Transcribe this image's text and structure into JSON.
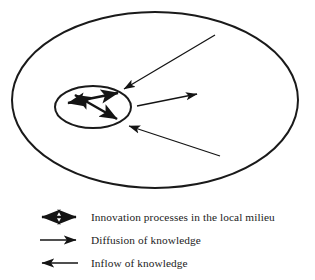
{
  "figure": {
    "background_color": "#ffffff",
    "stroke_color": "#1a1a1a"
  },
  "diagram": {
    "outer_region": {
      "name": "outer-ellipse",
      "role": "wider region surrounding the local milieu",
      "cx": 155,
      "cy": 100,
      "rx": 143,
      "ry": 88,
      "stroke_width": 2.0
    },
    "inner_region": {
      "name": "inner-ellipse",
      "role": "local milieu",
      "cx": 93,
      "cy": 107,
      "rx": 38,
      "ry": 21,
      "stroke_width": 2.0
    },
    "internal_arrows": [
      {
        "name": "innovation-arrow-ne-sw",
        "type": "double-headed",
        "x1": 68,
        "y1": 103,
        "x2": 118,
        "y2": 93
      },
      {
        "name": "innovation-arrow-nw-se",
        "type": "double-headed",
        "x1": 75,
        "y1": 95,
        "x2": 117,
        "y2": 119
      }
    ],
    "external_arrows": [
      {
        "name": "inflow-arrow-top",
        "type": "single-headed",
        "direction": "inward",
        "x1": 215,
        "y1": 35,
        "x2": 124,
        "y2": 89
      },
      {
        "name": "diffusion-arrow-middle",
        "type": "single-headed",
        "direction": "outward",
        "x1": 137,
        "y1": 106,
        "x2": 197,
        "y2": 94
      },
      {
        "name": "inflow-arrow-bottom",
        "type": "single-headed",
        "direction": "inward",
        "x1": 220,
        "y1": 156,
        "x2": 129,
        "y2": 126
      }
    ]
  },
  "legend": {
    "items": [
      {
        "symbol": "double-headed-arrow-icon",
        "arrow_type": "double",
        "label": "Innovation processes in the local milieu"
      },
      {
        "symbol": "right-arrow-icon",
        "arrow_type": "right",
        "label": "Diffusion of knowledge"
      },
      {
        "symbol": "left-arrow-icon",
        "arrow_type": "left",
        "label": "Inflow of knowledge"
      }
    ]
  }
}
